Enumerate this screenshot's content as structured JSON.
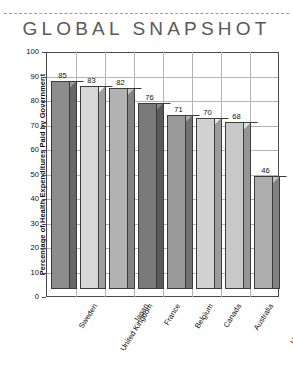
{
  "chart_data": {
    "type": "bar",
    "title": "GLOBAL SNAPSHOT",
    "xlabel": "",
    "ylabel": "Percentage of Health Expenditures Paid by Government",
    "ylim": [
      0,
      100
    ],
    "ytick_step": 10,
    "yticks": [
      "100",
      "90",
      "80",
      "70",
      "60",
      "50",
      "40",
      "30",
      "20",
      "10",
      "0"
    ],
    "grid": "both",
    "legend": "none",
    "style": "3d-column",
    "categories": [
      "Sweden",
      "United Kingdom",
      "Japan",
      "France",
      "Belgium",
      "Canada",
      "Australia",
      "United States"
    ],
    "values": [
      85,
      83,
      82,
      76,
      71,
      70,
      68,
      46
    ],
    "value_labels": [
      "85",
      "83",
      "82",
      "76",
      "71",
      "70",
      "68",
      "46"
    ],
    "bar_colors": [
      "#8d8d8d",
      "#d7d7d7",
      "#b3b3b3",
      "#7a7a7a",
      "#9a9a9a",
      "#d2d2d2",
      "#c9c9c9",
      "#aeaeae"
    ]
  },
  "colors": {
    "title": "#595959",
    "axis": "#4a4a4a",
    "grid": "#b4b4b4",
    "bar_outline": "#3c3c3c",
    "background": "#ffffff"
  }
}
